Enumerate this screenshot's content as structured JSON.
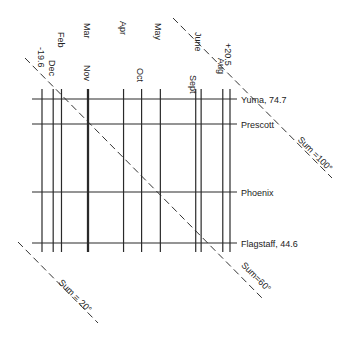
{
  "chart_data": {
    "type": "nomogram",
    "title": "",
    "month_labels_top": [
      {
        "label": "-19.6",
        "key": "min"
      },
      {
        "label": "Feb",
        "key": "feb"
      },
      {
        "label": "Mar",
        "key": "mar"
      },
      {
        "label": "Apr",
        "key": "apr"
      },
      {
        "label": "May",
        "key": "may"
      },
      {
        "label": "June",
        "key": "jun"
      },
      {
        "label": "+20.5",
        "key": "max"
      }
    ],
    "month_labels_bottom": [
      {
        "label": "Dec",
        "key": "dec"
      },
      {
        "label": "Nov",
        "key": "nov"
      },
      {
        "label": "Oct",
        "key": "oct"
      },
      {
        "label": "Sept",
        "key": "sep"
      },
      {
        "label": "Aug",
        "key": "aug"
      }
    ],
    "vertical_lines": [
      {
        "key": "min",
        "value": -19.6
      },
      {
        "key": "dec",
        "value": -16.5
      },
      {
        "key": "feb",
        "value": -14.2
      },
      {
        "key": "mar",
        "value": -7.0
      },
      {
        "key": "nov",
        "value": -6.7
      },
      {
        "key": "apr",
        "value": 3.0
      },
      {
        "key": "oct",
        "value": 8.0
      },
      {
        "key": "may",
        "value": 13.2
      },
      {
        "key": "sep",
        "value": 23.0
      },
      {
        "key": "jun",
        "value": 24.5
      },
      {
        "key": "aug",
        "value": 30.5
      },
      {
        "key": "max",
        "value": 32.5
      }
    ],
    "x_range": [
      -22,
      34
    ],
    "cities": [
      {
        "name": "Yuma, 74.7",
        "value": 74.7
      },
      {
        "name": "Prescott",
        "value": 66.5
      },
      {
        "name": "Phoenix",
        "value": 46.0
      },
      {
        "name": "Flagstaff, 44.6",
        "value": 44.6
      }
    ],
    "city_range": [
      42,
      78
    ],
    "sum_lines": [
      {
        "label": "Sum = 20°",
        "value": 20
      },
      {
        "label": "Sum=60°",
        "value": 60
      },
      {
        "label": "Sum =100°",
        "value": 100
      }
    ]
  }
}
